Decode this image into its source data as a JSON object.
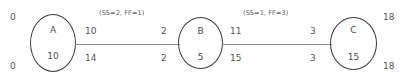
{
  "diagram": {
    "type": "activity-on-node-network",
    "corner_labels": {
      "top_left": "0",
      "bottom_left": "0",
      "top_right": "18",
      "bottom_right": "18"
    },
    "nodes": [
      {
        "id": "A",
        "label": "A",
        "duration": "10"
      },
      {
        "id": "B",
        "label": "B",
        "duration": "5"
      },
      {
        "id": "C",
        "label": "C",
        "duration": "15"
      }
    ],
    "edges": [
      {
        "from": "A",
        "to": "B",
        "annotation": "(SS=2, FF=1)",
        "tail_top": "10",
        "tail_bottom": "14",
        "head_top": "2",
        "head_bottom": "2"
      },
      {
        "from": "B",
        "to": "C",
        "annotation": "(SS=1, FF=3)",
        "tail_top": "11",
        "tail_bottom": "15",
        "head_top": "3",
        "head_bottom": "3"
      }
    ],
    "colors": {
      "node_stroke": "#3b3b3b",
      "connector": "#8c8c8c",
      "text": "#555555",
      "background": "#ffffff"
    }
  }
}
